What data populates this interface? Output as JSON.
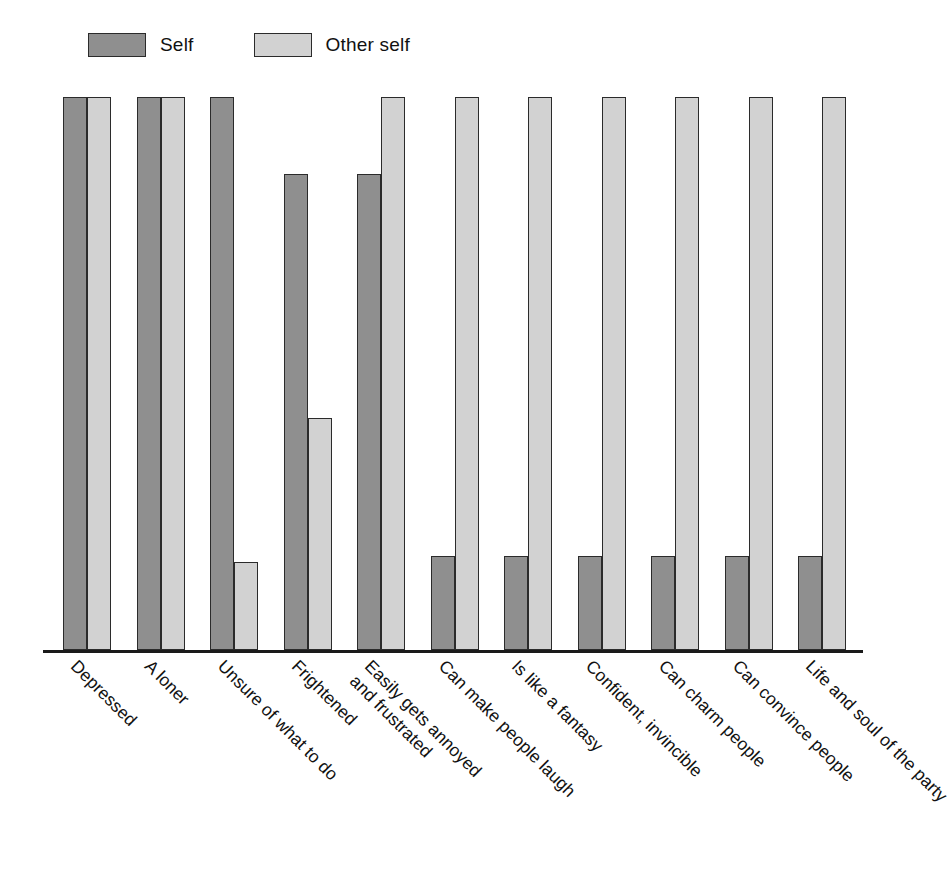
{
  "legend": {
    "position": "top-left",
    "entries": [
      {
        "label": "Self",
        "key": "self",
        "color": "#8f8f8f"
      },
      {
        "label": "Other self",
        "key": "otherself",
        "color": "#d2d2d2"
      }
    ]
  },
  "chart_data": {
    "type": "bar",
    "title": "",
    "subtitle": "",
    "xlabel": "",
    "ylabel": "",
    "ylim": [
      0,
      100
    ],
    "grid": false,
    "legend_position": "top-left",
    "orientation": "vertical",
    "grouping": "grouped",
    "categories": [
      "Depressed",
      "A loner",
      "Unsure of what to do",
      "Frightened",
      "Easily gets annoyed and frustrated",
      "Can make people laugh",
      "Is like a fantasy",
      "Confident, invincible",
      "Can charm people",
      "Can convince people",
      "Life and soul of the party"
    ],
    "category_lines": [
      [
        "Depressed"
      ],
      [
        "A loner"
      ],
      [
        "Unsure of what to do"
      ],
      [
        "Frightened"
      ],
      [
        "Easily gets annoyed",
        "and frustrated"
      ],
      [
        "Can make people laugh"
      ],
      [
        "Is like a fantasy"
      ],
      [
        "Confident, invincible"
      ],
      [
        "Can charm people"
      ],
      [
        "Can convince people"
      ],
      [
        "Life and soul of the party"
      ]
    ],
    "series": [
      {
        "name": "Self",
        "color": "#8f8f8f",
        "values": [
          100,
          100,
          100,
          86,
          86,
          17,
          17,
          17,
          17,
          17,
          17
        ]
      },
      {
        "name": "Other self",
        "color": "#d2d2d2",
        "values": [
          100,
          100,
          16,
          42,
          100,
          100,
          100,
          100,
          100,
          100,
          100
        ]
      }
    ]
  },
  "geometry": {
    "group_pitch": 73.5,
    "group_start": 20,
    "bar_width": 24,
    "bar_gap": 0
  }
}
